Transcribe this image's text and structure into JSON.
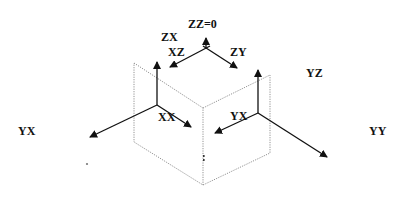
{
  "diagram": {
    "type": "coordinate-axes-cube",
    "colors": {
      "axis": "#111111",
      "plane": "#777777",
      "label": "#111111",
      "background": "#ffffff"
    },
    "labels": {
      "zz": "ZZ=0",
      "zx": "ZX",
      "xz": "XZ",
      "zy": "ZY",
      "yz": "YZ",
      "yx_left": "YX",
      "xx": "XX",
      "yx_right": "YX",
      "yy": "YY"
    },
    "axis_groups": [
      {
        "name": "top",
        "origin": [
          206,
          49
        ],
        "axes": [
          "ZZ (up)",
          "XZ (down-left)",
          "ZY (down-right)"
        ]
      },
      {
        "name": "left",
        "origin": [
          157,
          104
        ],
        "axes": [
          "ZX (up)",
          "YX (down-left)",
          "XX (down-right)"
        ]
      },
      {
        "name": "right",
        "origin": [
          258,
          112
        ],
        "axes": [
          "YZ (up)",
          "YX (down-left)",
          "YY (down-right)"
        ]
      }
    ]
  }
}
